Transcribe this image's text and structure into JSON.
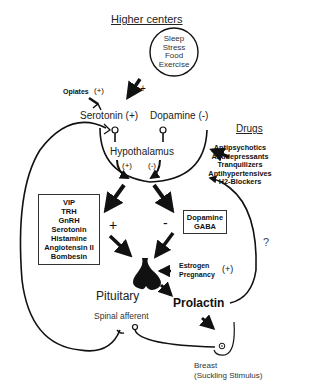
{
  "diagram": {
    "higher_centers": {
      "title": "Higher centers",
      "circle_items": [
        "Sleep",
        "Stress",
        "Food",
        "Exercise"
      ],
      "arrow_sign": "+"
    },
    "opiates": {
      "label": "Opiates",
      "sign": "(+)"
    },
    "serotonin": {
      "label": "Serotonin",
      "sign": "(+)"
    },
    "dopamine": {
      "label": "Dopamine",
      "sign": "(-)"
    },
    "hypothalamus": {
      "label": "Hypothalamus",
      "left_sign": "(+)",
      "right_sign": "(-)"
    },
    "drugs": {
      "title": "Drugs",
      "items": [
        "Antipsychotics",
        "Antidepressants",
        "Tranquilizers",
        "Antihypertensives",
        "H2-Blockers"
      ]
    },
    "stimulators": {
      "sign": "+",
      "items": [
        "VIP",
        "TRH",
        "GnRH",
        "Serotonin",
        "Histamine",
        "Angiotensin II",
        "Bombesin"
      ]
    },
    "inhibitors": {
      "sign": "-",
      "items": [
        "Dopamine",
        "GABA"
      ]
    },
    "estrogen": {
      "items": [
        "Estrogen",
        "Pregnancy"
      ],
      "sign": "(+)"
    },
    "feedback_question": "?",
    "pituitary": {
      "label": "Pituitary"
    },
    "prolactin": {
      "label": "Prolactin"
    },
    "spinal_afferent": {
      "label": "Spinal afferent"
    },
    "breast": {
      "label": "Breast",
      "sublabel": "(Suckling Stimulus)"
    }
  }
}
